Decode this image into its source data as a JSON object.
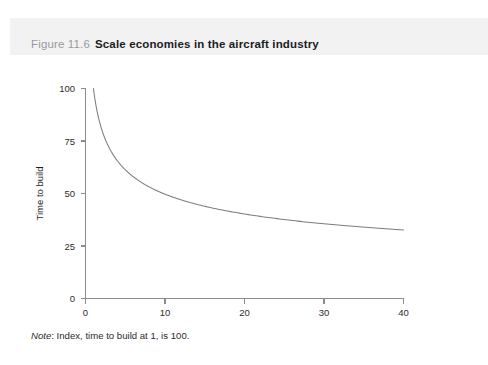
{
  "figure": {
    "number": "Figure 11.6",
    "title": "Scale economies in the aircraft industry",
    "note_label": "Note",
    "note_text": ": Index, time to build at 1, is 100."
  },
  "colors": {
    "caption_band": "#f2f2f3",
    "figure_number": "#9a9a9c",
    "figure_title": "#1d1d1f",
    "axis": "#8c8c90",
    "curve": "#7d7d81",
    "background": "#ffffff"
  },
  "chart_data": {
    "type": "line",
    "title": "Scale economies in the aircraft industry",
    "subtitle": "",
    "xlabel": "Number of aircraft",
    "ylabel": "Time to build",
    "xlim": [
      0,
      40
    ],
    "ylim": [
      0,
      100
    ],
    "xticks": [
      0,
      10,
      20,
      30,
      40
    ],
    "yticks": [
      0,
      25,
      50,
      75,
      100
    ],
    "xtick_labels": [
      "0",
      "10",
      "20",
      "30",
      "40"
    ],
    "ytick_labels": [
      "0",
      "25",
      "50",
      "75",
      "100"
    ],
    "grid": false,
    "legend": false,
    "legend_position": "none",
    "annotations": [
      "Note: Index, time to build at 1, is 100."
    ],
    "series": [
      {
        "name": "Time to build index",
        "formula": "y = 100 * x^(-0.3)",
        "x": [
          1,
          2,
          3,
          4,
          5,
          6,
          7,
          8,
          9,
          10,
          12,
          14,
          16,
          18,
          20,
          22,
          24,
          26,
          28,
          30,
          32,
          34,
          36,
          38,
          40
        ],
        "values": [
          100,
          81.2,
          71.7,
          65.9,
          61.8,
          58.6,
          56.1,
          53.5,
          51.9,
          50.1,
          47.2,
          44.9,
          43.0,
          41.5,
          40.1,
          39.0,
          37.9,
          37.0,
          36.2,
          35.5,
          34.8,
          34.2,
          33.6,
          33.1,
          32.6
        ]
      }
    ]
  }
}
